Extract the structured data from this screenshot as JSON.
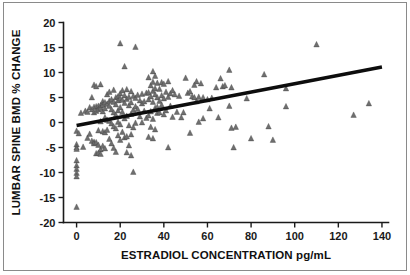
{
  "figure": {
    "background_color": "#ffffff",
    "frame_color": "#8a8a8a",
    "axis_color": "#1a1a1a"
  },
  "chart_data": {
    "type": "scatter",
    "title": "",
    "xlabel": "ESTRADIOL CONCENTRATION pg/mL",
    "ylabel": "LUMBAR SPINE BMD % CHANGE",
    "xlim": [
      -6,
      143
    ],
    "ylim": [
      -20,
      20
    ],
    "xticks": [
      0,
      20,
      40,
      60,
      80,
      100,
      120,
      140
    ],
    "xtick_labels": [
      "0",
      "20",
      "40",
      "60",
      "80",
      "100",
      "120",
      "140"
    ],
    "yticks": [
      -20,
      -15,
      -10,
      -5,
      0,
      5,
      10,
      15,
      20
    ],
    "ytick_labels": [
      "-20",
      "-15",
      "-10",
      "-5",
      "0",
      "5",
      "10",
      "15",
      "20"
    ],
    "grid": false,
    "legend": false,
    "marker_shape": "triangle",
    "marker_color": "#6f6f6f",
    "trendline": {
      "type": "linear",
      "color": "#0d0d0d",
      "x_start": 0,
      "y_start": -0.6,
      "x_end": 140,
      "y_end": 11.1
    },
    "points": [
      [
        0,
        -1.7
      ],
      [
        0,
        -4.4
      ],
      [
        0,
        -5.0
      ],
      [
        0,
        -5.3
      ],
      [
        0,
        -7.6
      ],
      [
        0,
        -8.6
      ],
      [
        0,
        -9.3
      ],
      [
        0,
        -10.1
      ],
      [
        0,
        -10.8
      ],
      [
        0,
        -16.9
      ],
      [
        1,
        -2.2
      ],
      [
        2,
        1.9
      ],
      [
        3,
        -4.9
      ],
      [
        4,
        2.3
      ],
      [
        5,
        2.1
      ],
      [
        5,
        -3.1
      ],
      [
        6,
        3.0
      ],
      [
        6,
        -2.3
      ],
      [
        7,
        2.6
      ],
      [
        7,
        5.0
      ],
      [
        7,
        -3.7
      ],
      [
        8,
        7.5
      ],
      [
        8,
        3.1
      ],
      [
        8,
        2.0
      ],
      [
        8,
        -3.9
      ],
      [
        8,
        -4.2
      ],
      [
        9,
        7.2
      ],
      [
        9,
        3.2
      ],
      [
        9,
        2.3
      ],
      [
        9,
        -4.0
      ],
      [
        9,
        -6.2
      ],
      [
        10,
        3.3
      ],
      [
        10,
        2.6
      ],
      [
        10,
        -1.6
      ],
      [
        10,
        -4.5
      ],
      [
        10,
        -6.1
      ],
      [
        11,
        7.6
      ],
      [
        11,
        3.4
      ],
      [
        11,
        2.9
      ],
      [
        11,
        0.2
      ],
      [
        11,
        -5.4
      ],
      [
        11,
        -6.3
      ],
      [
        12,
        4.2
      ],
      [
        12,
        3.5
      ],
      [
        12,
        2.2
      ],
      [
        12,
        -1.8
      ],
      [
        12,
        -4.7
      ],
      [
        13,
        4.0
      ],
      [
        13,
        2.8
      ],
      [
        13,
        1.0
      ],
      [
        13,
        -2.0
      ],
      [
        13,
        -5.2
      ],
      [
        14,
        5.6
      ],
      [
        14,
        3.7
      ],
      [
        14,
        0.5
      ],
      [
        14,
        -1.5
      ],
      [
        15,
        6.1
      ],
      [
        15,
        4.3
      ],
      [
        15,
        3.3
      ],
      [
        15,
        0.3
      ],
      [
        15,
        -3.3
      ],
      [
        16,
        4.6
      ],
      [
        16,
        2.6
      ],
      [
        16,
        -0.2
      ],
      [
        16,
        -4.2
      ],
      [
        17,
        6.5
      ],
      [
        17,
        4.1
      ],
      [
        17,
        2.0
      ],
      [
        17,
        -0.8
      ],
      [
        17,
        -5.1
      ],
      [
        18,
        5.0
      ],
      [
        18,
        3.6
      ],
      [
        18,
        1.5
      ],
      [
        18,
        -1.2
      ],
      [
        18,
        -5.9
      ],
      [
        19,
        5.2
      ],
      [
        19,
        4.4
      ],
      [
        19,
        2.4
      ],
      [
        19,
        0.1
      ],
      [
        19,
        -2.6
      ],
      [
        20,
        15.8
      ],
      [
        20,
        5.8
      ],
      [
        20,
        4.8
      ],
      [
        20,
        3.0
      ],
      [
        20,
        -0.4
      ],
      [
        20,
        -3.5
      ],
      [
        21,
        6.4
      ],
      [
        21,
        4.5
      ],
      [
        21,
        2.1
      ],
      [
        21,
        -1.9
      ],
      [
        22,
        11.2
      ],
      [
        22,
        5.4
      ],
      [
        22,
        3.9
      ],
      [
        22,
        0.8
      ],
      [
        22,
        -3.0
      ],
      [
        23,
        6.6
      ],
      [
        23,
        4.7
      ],
      [
        23,
        1.3
      ],
      [
        23,
        -2.8
      ],
      [
        23,
        -6.0
      ],
      [
        24,
        5.1
      ],
      [
        24,
        3.4
      ],
      [
        24,
        -0.6
      ],
      [
        24,
        -4.6
      ],
      [
        25,
        6.2
      ],
      [
        25,
        4.0
      ],
      [
        25,
        1.7
      ],
      [
        25,
        -2.4
      ],
      [
        25,
        -6.6
      ],
      [
        26,
        5.3
      ],
      [
        26,
        2.5
      ],
      [
        26,
        -1.0
      ],
      [
        26,
        -9.9
      ],
      [
        27,
        15.1
      ],
      [
        27,
        4.9
      ],
      [
        27,
        3.2
      ],
      [
        27,
        -0.1
      ],
      [
        28,
        5.5
      ],
      [
        28,
        2.7
      ],
      [
        29,
        4.4
      ],
      [
        29,
        1.2
      ],
      [
        30,
        5.7
      ],
      [
        30,
        3.8
      ],
      [
        30,
        0.0
      ],
      [
        31,
        4.2
      ],
      [
        31,
        2.3
      ],
      [
        32,
        5.9
      ],
      [
        32,
        0.9
      ],
      [
        33,
        9.0
      ],
      [
        33,
        6.0
      ],
      [
        33,
        4.6
      ],
      [
        33,
        1.4
      ],
      [
        33,
        -2.9
      ],
      [
        34,
        7.4
      ],
      [
        34,
        5.2
      ],
      [
        34,
        2.2
      ],
      [
        34,
        -0.9
      ],
      [
        35,
        10.2
      ],
      [
        35,
        8.1
      ],
      [
        35,
        6.3
      ],
      [
        35,
        4.1
      ],
      [
        35,
        0.7
      ],
      [
        35,
        -3.2
      ],
      [
        36,
        9.3
      ],
      [
        36,
        6.8
      ],
      [
        36,
        5.6
      ],
      [
        36,
        2.9
      ],
      [
        36,
        -1.4
      ],
      [
        37,
        7.9
      ],
      [
        37,
        5.0
      ],
      [
        37,
        3.1
      ],
      [
        37,
        1.9
      ],
      [
        38,
        6.7
      ],
      [
        38,
        4.3
      ],
      [
        38,
        2.0
      ],
      [
        39,
        8.0
      ],
      [
        39,
        5.4
      ],
      [
        39,
        3.5
      ],
      [
        40,
        7.7
      ],
      [
        40,
        4.8
      ],
      [
        40,
        1.6
      ],
      [
        41,
        6.1
      ],
      [
        41,
        2.4
      ],
      [
        42,
        8.2
      ],
      [
        42,
        5.1
      ],
      [
        42,
        -5.0
      ],
      [
        43,
        5.8
      ],
      [
        43,
        3.3
      ],
      [
        44,
        6.4
      ],
      [
        44,
        1.1
      ],
      [
        45,
        5.6
      ],
      [
        46,
        2.1
      ],
      [
        47,
        5.3
      ],
      [
        48,
        1.0
      ],
      [
        49,
        2.0
      ],
      [
        50,
        8.9
      ],
      [
        51,
        5.9
      ],
      [
        52,
        6.2
      ],
      [
        52,
        -2.1
      ],
      [
        53,
        5.2
      ],
      [
        54,
        7.5
      ],
      [
        54,
        5.0
      ],
      [
        55,
        8.2
      ],
      [
        55,
        4.2
      ],
      [
        56,
        5.1
      ],
      [
        56,
        0.1
      ],
      [
        57,
        7.8
      ],
      [
        58,
        5.0
      ],
      [
        58,
        0.8
      ],
      [
        60,
        4.6
      ],
      [
        61,
        2.8
      ],
      [
        62,
        4.9
      ],
      [
        64,
        7.0
      ],
      [
        65,
        1.0
      ],
      [
        66,
        8.8
      ],
      [
        67,
        7.2
      ],
      [
        68,
        7.4
      ],
      [
        70,
        10.5
      ],
      [
        70,
        3.3
      ],
      [
        71,
        7.0
      ],
      [
        71,
        -1.1
      ],
      [
        72,
        -5.0
      ],
      [
        73,
        -0.9
      ],
      [
        78,
        4.8
      ],
      [
        80,
        -3.2
      ],
      [
        86,
        9.6
      ],
      [
        88,
        -0.8
      ],
      [
        90,
        -3.5
      ],
      [
        96,
        6.8
      ],
      [
        96,
        3.2
      ],
      [
        110,
        15.6
      ],
      [
        127,
        1.5
      ],
      [
        134,
        3.8
      ]
    ]
  }
}
